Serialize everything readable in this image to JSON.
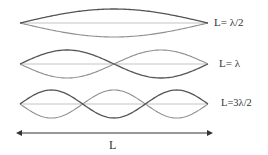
{
  "diagram": {
    "colors": {
      "wave_dark": "#555555",
      "wave_light": "#8f8f8f",
      "axis_line": "#c4c4c4",
      "arrow": "#333333",
      "text": "#333333"
    },
    "geometry": {
      "x_start": 20,
      "x_end": 208,
      "amplitude": 14
    },
    "modes": [
      {
        "id": "mode-1",
        "antinodes": 1,
        "center_y": 23,
        "label": "L= λ/2"
      },
      {
        "id": "mode-2",
        "antinodes": 2,
        "center_y": 64,
        "label": "L= λ"
      },
      {
        "id": "mode-3",
        "antinodes": 3,
        "center_y": 104,
        "label": "L=3λ/2"
      }
    ],
    "length_arrow": {
      "y": 133,
      "x_start": 16,
      "x_end": 213,
      "label": "L"
    }
  }
}
